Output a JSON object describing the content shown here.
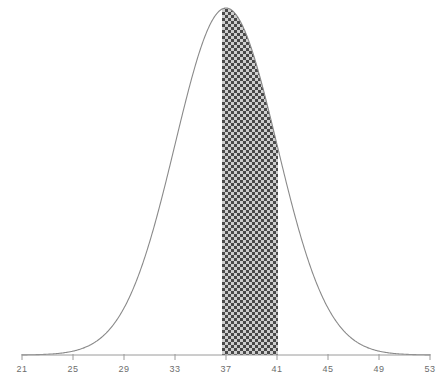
{
  "figure": {
    "title": "",
    "background_color": "#ffffff",
    "width": 445,
    "height": 385
  },
  "axis": {
    "line_color": "#9a9a9a",
    "baseline_y": 355,
    "x_start_px": 22,
    "x_end_px": 430,
    "tick_length_px": 5,
    "label_color": "#6d6d6d"
  },
  "curve": {
    "color": "#8a8a8a",
    "stroke_width": 1.1,
    "peak_x_px": 219,
    "peak_y_px": 8
  },
  "shading": {
    "label": "shaded-area-37-to-41",
    "from": 37,
    "to": 41,
    "left_px": 222,
    "right_px": 278,
    "pattern": "checkerboard-crosshatch",
    "pattern_cell_px": 3,
    "color_dark": "#4a4a4a",
    "color_light": "#b9b9b9",
    "color_background": "#ffffff"
  },
  "chart_data": {
    "type": "area",
    "title": "",
    "xlabel": "",
    "ylabel": "",
    "distribution": "normal",
    "mean": 37,
    "std_dev": 4,
    "xlim": [
      21,
      53
    ],
    "ylim": [
      0,
      1
    ],
    "grid": false,
    "legend": null,
    "tick_values": [
      21,
      25,
      29,
      33,
      37,
      41,
      45,
      49,
      53
    ],
    "tick_labels": [
      "21",
      "25",
      "29",
      "33",
      "37",
      "41",
      "45",
      "49",
      "53"
    ],
    "tick_interval": 4,
    "shaded_interval": {
      "from": 37,
      "to": 41,
      "description": "Area under normal curve between 37 and 41"
    },
    "x": [
      21,
      23,
      25,
      27,
      29,
      31,
      33,
      35,
      37,
      39,
      41,
      43,
      45,
      47,
      49,
      51,
      53
    ],
    "y": [
      0.0088,
      0.0228,
      0.054,
      0.1173,
      0.2325,
      0.4214,
      0.6977,
      0.8825,
      1.0,
      0.8825,
      0.6977,
      0.4214,
      0.2325,
      0.1173,
      0.054,
      0.0228,
      0.0088
    ],
    "series": [
      {
        "name": "normal-density",
        "values": [
          0.0088,
          0.0228,
          0.054,
          0.1173,
          0.2325,
          0.4214,
          0.6977,
          0.8825,
          1.0,
          0.8825,
          0.6977,
          0.4214,
          0.2325,
          0.1173,
          0.054,
          0.0228,
          0.0088
        ]
      }
    ]
  }
}
